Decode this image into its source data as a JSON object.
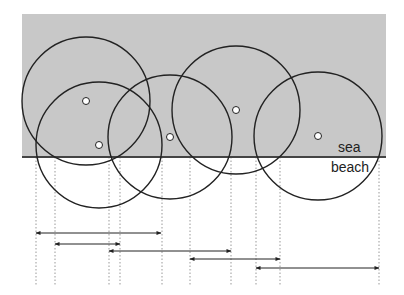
{
  "diagram": {
    "colors": {
      "sea": "#c8c8c8",
      "beach": "#ffffff",
      "stroke": "#222222",
      "shoreline": "#444444",
      "guide": "#999999",
      "dot_fill": "#ffffff"
    },
    "labels": {
      "sea": "sea",
      "beach": "beach"
    },
    "sea_region": {
      "x": 22,
      "y": 14,
      "width": 364,
      "height": 143
    },
    "shoreline_y": 157,
    "circles": [
      {
        "cx": 86,
        "cy": 101,
        "r": 64
      },
      {
        "cx": 99,
        "cy": 145,
        "r": 63
      },
      {
        "cx": 170,
        "cy": 137,
        "r": 62
      },
      {
        "cx": 236,
        "cy": 110,
        "r": 64
      },
      {
        "cx": 318,
        "cy": 136,
        "r": 64
      }
    ],
    "guides_x": [
      36,
      55,
      109,
      120,
      162,
      190,
      231,
      256,
      280,
      379
    ],
    "guides_y": [
      157,
      285
    ],
    "intervals": [
      {
        "x1": 36,
        "x2": 161,
        "y": 233
      },
      {
        "x1": 55,
        "x2": 120,
        "y": 244
      },
      {
        "x1": 109,
        "x2": 231,
        "y": 251
      },
      {
        "x1": 190,
        "x2": 280,
        "y": 259
      },
      {
        "x1": 256,
        "x2": 379,
        "y": 268
      }
    ]
  }
}
